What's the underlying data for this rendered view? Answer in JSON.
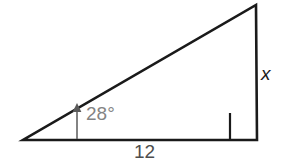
{
  "figure": {
    "kind": "right-triangle-diagram",
    "background_color": "#ffffff",
    "stroke_color": "#1a1a1a",
    "angle_text_color": "#848484",
    "base_text_color": "#4d4d4d",
    "side_text_color": "#1a1a1a"
  },
  "labels": {
    "angle": "28°",
    "opposite_side": "x",
    "adjacent_side": "12"
  },
  "geometry": {
    "left_vertex": "23,140",
    "right_vertex": "257,140",
    "apex_vertex": "256,5",
    "triangle_points": "23,140 257,140 256,5",
    "right_angle_marker": "230,113 230,140 257,140",
    "angle_arrow_line_x": 77,
    "angle_arrow_base_y": 139,
    "angle_arrow_tip_y": 107
  }
}
